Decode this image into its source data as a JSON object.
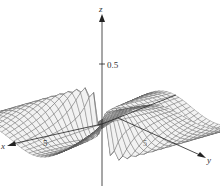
{
  "chart_data": {
    "type": "surface3d",
    "title": "",
    "function_hint": "saddle-like surface with sharp ridge near origin, values between about -0.5 and 0.5",
    "axes": {
      "x": {
        "label": "x",
        "ticks": [
          {
            "value": 5,
            "label": "5"
          }
        ]
      },
      "y": {
        "label": "y",
        "ticks": [
          {
            "value": 5,
            "label": "5"
          }
        ]
      },
      "z": {
        "label": "z",
        "ticks": [
          {
            "value": 0.5,
            "label": "0.5"
          }
        ]
      }
    },
    "zlim": [
      -0.5,
      0.5
    ],
    "grid": false,
    "legend": null,
    "style": {
      "mesh_color": "#555555",
      "surface_fill": "#f2f2f2",
      "axis_color": "#222222"
    }
  },
  "labels": {
    "x_axis": "x",
    "y_axis": "y",
    "z_axis": "z",
    "x_tick": "5",
    "y_tick": "5",
    "z_tick": "0.5"
  }
}
